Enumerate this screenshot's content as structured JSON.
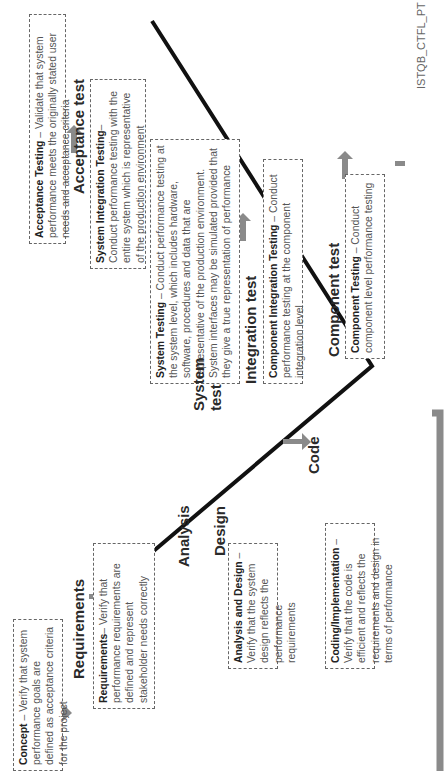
{
  "diagram": {
    "watermark": "ISTQB_CTFL_PT",
    "left_branch": {
      "phases": [
        {
          "label": "Requirements"
        },
        {
          "label": "Analysis"
        },
        {
          "label": "Design"
        },
        {
          "label": "Code"
        }
      ],
      "boxes": [
        {
          "title": "Concept",
          "sep": " – ",
          "text": "Verify that system performance goals are defined as acceptance criteria for the project"
        },
        {
          "title": "Requirements",
          "sep": "– ",
          "text": "Verify that performance requirements are defined and represent stakeholder needs correctly"
        },
        {
          "title": "Analysis and Design",
          "sep": " – ",
          "text": "Verify that the system design reflects the performance requirements"
        },
        {
          "title": "Coding/Implementation",
          "sep": " – ",
          "text": "Verify that the code is efficient and reflects the requirements and design in terms of performance"
        }
      ]
    },
    "right_branch": {
      "phases": [
        {
          "label": "Component test"
        },
        {
          "label": "Integration test"
        },
        {
          "label": "System test"
        },
        {
          "label": "Acceptance test"
        }
      ],
      "boxes": [
        {
          "title": "Component Testing",
          "sep": " – ",
          "text": "Conduct component level performance testing"
        },
        {
          "title": "Component Integration Testing",
          "sep": " – ",
          "text": "Conduct performance testing at the component integration level"
        },
        {
          "title": "System Testing",
          "sep": " – ",
          "text": "Conduct performance testing at the system level, which includes hardware, software, procedures and data that are representative of the production environment. System interfaces may be simulated provided that they give a true representation of performance"
        },
        {
          "title": "System Integration Testing",
          "sep": "– ",
          "text": "Conduct performance testing with the entire system which is representative of the production environment"
        },
        {
          "title": "Acceptance Testing",
          "sep": " – ",
          "text": "Validate that system performance meets the originally stated user needs and acceptance criteria"
        }
      ]
    },
    "colors": {
      "arrow": "#8a8a8a",
      "v_line": "#111111",
      "box_border": "#666666"
    }
  }
}
